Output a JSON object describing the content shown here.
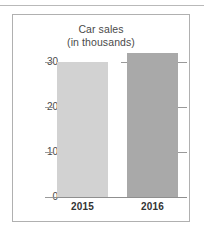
{
  "chart_data": {
    "type": "bar",
    "title": "Car sales (in thousands)",
    "title_lines": [
      "Car sales",
      "(in thousands)"
    ],
    "categories": [
      "2015",
      "2016"
    ],
    "values": [
      30,
      32
    ],
    "xlabel": "",
    "ylabel": "",
    "ylim": [
      0,
      30
    ],
    "yticks": [
      0,
      10,
      20,
      30
    ],
    "ytick_labels": [
      "0",
      "10",
      "20",
      "30"
    ],
    "grid": false,
    "legend": "none",
    "series": [
      {
        "name": "Car sales",
        "values": [
          30,
          32
        ]
      }
    ],
    "bar_colors": [
      "#d2d2d2",
      "#a9a9a9"
    ]
  },
  "frame": {
    "border_color": "#b0b0b0",
    "axis_color": "#8f8f8f",
    "tick_color": "#9a9a9a",
    "text_color": "#4a4a4a"
  }
}
